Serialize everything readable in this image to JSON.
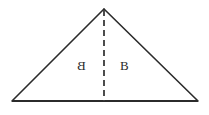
{
  "figure": {
    "type": "geometry-diagram",
    "shape": "triangle",
    "background_color": "#ffffff",
    "stroke_color": "#2b2b2b",
    "canvas": {
      "width": 209,
      "height": 115
    },
    "vertices": {
      "apex": {
        "x": 104,
        "y": 9
      },
      "bottom_left": {
        "x": 12,
        "y": 101
      },
      "bottom_right": {
        "x": 198,
        "y": 101
      }
    },
    "edges": [
      {
        "name": "left-side",
        "from": "apex",
        "to": "bottom_left",
        "style": "solid",
        "width": 1.6
      },
      {
        "name": "right-side",
        "from": "apex",
        "to": "bottom_right",
        "style": "solid",
        "width": 1.6
      },
      {
        "name": "base",
        "from": "bottom_left",
        "to": "bottom_right",
        "style": "solid",
        "width": 2.2
      }
    ],
    "altitude": {
      "name": "altitude-dashed-line",
      "from": {
        "x": 104,
        "y": 9
      },
      "to": {
        "x": 104,
        "y": 101
      },
      "style": "dashed",
      "dash_length": 6,
      "gap_length": 4,
      "width": 1.8
    },
    "labels": {
      "left": {
        "text": "B",
        "mirrored": true,
        "x": 77,
        "y": 59
      },
      "right": {
        "text": "B",
        "mirrored": false,
        "x": 120,
        "y": 59
      }
    }
  }
}
